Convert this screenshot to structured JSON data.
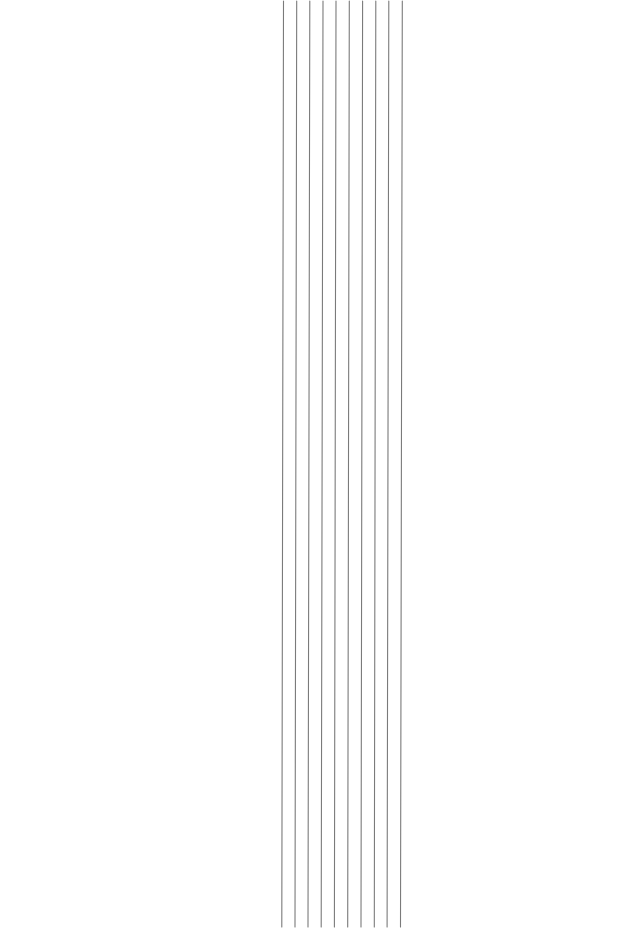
{
  "page": {
    "width": 643,
    "height": 930,
    "background": "#ffffff"
  },
  "lines": {
    "count": 10,
    "color": "#7a7a7a",
    "orientation": "vertical",
    "items": [
      {
        "x_top": 283.5,
        "x_bottom": 281.8,
        "y_top": 1,
        "y_bottom": 927
      },
      {
        "x_top": 296.7,
        "x_bottom": 295.0,
        "y_top": 1,
        "y_bottom": 927
      },
      {
        "x_top": 309.8,
        "x_bottom": 308.0,
        "y_top": 1,
        "y_bottom": 927
      },
      {
        "x_top": 323.0,
        "x_bottom": 321.2,
        "y_top": 1,
        "y_bottom": 927
      },
      {
        "x_top": 336.0,
        "x_bottom": 334.4,
        "y_top": 1,
        "y_bottom": 927
      },
      {
        "x_top": 349.3,
        "x_bottom": 347.7,
        "y_top": 1,
        "y_bottom": 927
      },
      {
        "x_top": 362.6,
        "x_bottom": 361.0,
        "y_top": 1,
        "y_bottom": 927
      },
      {
        "x_top": 375.8,
        "x_bottom": 374.3,
        "y_top": 1,
        "y_bottom": 927
      },
      {
        "x_top": 388.8,
        "x_bottom": 387.1,
        "y_top": 1,
        "y_bottom": 927
      },
      {
        "x_top": 402.3,
        "x_bottom": 400.5,
        "y_top": 1,
        "y_bottom": 927
      }
    ]
  }
}
